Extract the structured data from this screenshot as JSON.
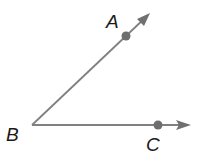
{
  "diagram": {
    "type": "geometry-angle",
    "colors": {
      "line": "#808080",
      "point": "#6e6e6e",
      "label": "#1a1a1a",
      "background": "#ffffff"
    },
    "vertex": {
      "label": "B",
      "x": 32,
      "y": 125
    },
    "rays": [
      {
        "name": "BA",
        "from": "B",
        "through": "A",
        "point": {
          "label": "A",
          "x": 126,
          "y": 36
        },
        "arrow_tip": {
          "x": 150,
          "y": 14
        }
      },
      {
        "name": "BC",
        "from": "B",
        "through": "C",
        "point": {
          "label": "C",
          "x": 158,
          "y": 125
        },
        "arrow_tip": {
          "x": 190,
          "y": 125
        }
      }
    ],
    "labels": {
      "A": "A",
      "B": "B",
      "C": "C"
    }
  }
}
